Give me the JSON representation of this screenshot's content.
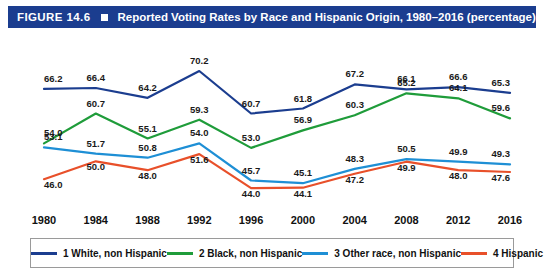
{
  "header": {
    "figure_number": "FIGURE 14.6",
    "title": "Reported Voting Rates by Race and Hispanic Origin, 1980–2016 (percentage)",
    "bar_color": "#1b3d8f",
    "square_marker": "white-square"
  },
  "chart_data": {
    "type": "line",
    "title": "Reported Voting Rates by Race and Hispanic Origin, 1980–2016 (percentage)",
    "xlabel": "",
    "ylabel": "",
    "ylim": [
      40,
      74
    ],
    "grid": false,
    "legend_position": "bottom",
    "categories": [
      "1980",
      "1984",
      "1988",
      "1992",
      "1996",
      "2000",
      "2004",
      "2008",
      "2012",
      "2016"
    ],
    "series": [
      {
        "name": "1 White, non Hispanic",
        "color": "#1b3d8f",
        "values": [
          66.2,
          66.4,
          64.2,
          70.2,
          60.7,
          61.8,
          67.2,
          66.1,
          66.6,
          65.3
        ]
      },
      {
        "name": "2 Black, non Hispanic",
        "color": "#1f9c3a",
        "values": [
          54.0,
          60.7,
          55.1,
          59.3,
          53.0,
          56.9,
          60.3,
          65.2,
          64.1,
          59.6
        ]
      },
      {
        "name": "3 Other race, non Hispanic",
        "color": "#1e8fd5",
        "values": [
          53.1,
          51.7,
          50.8,
          54.0,
          45.7,
          45.1,
          48.3,
          50.5,
          49.9,
          49.3
        ]
      },
      {
        "name": "4 Hispanic",
        "color": "#e8502a",
        "values": [
          46.0,
          50.0,
          48.0,
          51.6,
          44.0,
          44.1,
          47.2,
          49.9,
          48.0,
          47.6
        ]
      }
    ]
  },
  "legend": [
    {
      "label": "1 White, non Hispanic",
      "color": "#1b3d8f"
    },
    {
      "label": "2 Black, non Hispanic",
      "color": "#1f9c3a"
    },
    {
      "label": "3 Other race, non Hispanic",
      "color": "#1e8fd5"
    },
    {
      "label": "4 Hispanic",
      "color": "#e8502a"
    }
  ]
}
